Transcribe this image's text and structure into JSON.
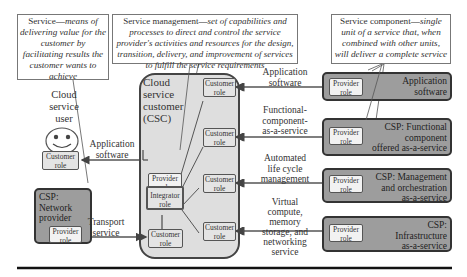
{
  "definitions": {
    "service": {
      "term": "Service",
      "definition": "means of delivering value for the customer by facilitating results the customer wants to achieve"
    },
    "service_management": {
      "term": "Service management",
      "definition": "set of capabilities and processes to direct and control the service provider's activities and resources for the design, transition, delivery, and improvement of services to fulfill the service requirements"
    },
    "service_component": {
      "term": "Service component",
      "definition": "single unit of a service that, when combined with other units, will deliver a complete service"
    }
  },
  "cloud_service_user": {
    "title_line1": "Cloud",
    "title_line2": "service",
    "title_line3": "user",
    "role_line1": "Customer",
    "role_line2": "role"
  },
  "network_provider": {
    "title_line1": "CSP:",
    "title_line2": "Network",
    "title_line3": "provider",
    "role_line1": "Provider",
    "role_line2": "role"
  },
  "csc": {
    "title_line1": "Cloud",
    "title_line2": "service",
    "title_line3": "customer",
    "title_line4": "(CSC)",
    "provider_role": {
      "line1": "Provider",
      "line2": "role"
    },
    "integrator_role": {
      "line1": "Integrator",
      "line2": "role"
    },
    "customer_role": {
      "line1": "Customer",
      "line2": "role"
    }
  },
  "flows": {
    "application_software_left": {
      "line1": "Application",
      "line2": "software"
    },
    "transport_service": {
      "line1": "Transport",
      "line2": "service"
    },
    "application_software": {
      "line1": "Application",
      "line2": "software"
    },
    "functional_component": {
      "line1": "Functional-",
      "line2": "component-",
      "line3": "as-a-service"
    },
    "automated_lifecycle": {
      "line1": "Automated",
      "line2": "life cycle",
      "line3": "management"
    },
    "virtual_compute": {
      "line1": "Virtual",
      "line2": "compute,",
      "line3": "memory",
      "line4": "storage, and",
      "line5": "networking",
      "line6": "service"
    }
  },
  "providers": [
    {
      "title_line1": "Application",
      "title_line2": "software",
      "title_line3": "",
      "role_line1": "Provider",
      "role_line2": "role"
    },
    {
      "title_line1": "CSP: Functional",
      "title_line2": "component",
      "title_line3": "offered as-a-service",
      "role_line1": "Provider",
      "role_line2": "role"
    },
    {
      "title_line1": "CSP: Management",
      "title_line2": "and orchestration",
      "title_line3": "as-a-service",
      "role_line1": "Provider",
      "role_line2": "role"
    },
    {
      "title_line1": "CSP:",
      "title_line2": "Infrastructure",
      "title_line3": "as-a-service",
      "role_line1": "Provider",
      "role_line2": "role"
    }
  ],
  "colors": {
    "csp_fill": "#9d9d9d",
    "csc_fill": "#dedede",
    "role_fill": "#f2f2f2",
    "border": "#333333"
  }
}
